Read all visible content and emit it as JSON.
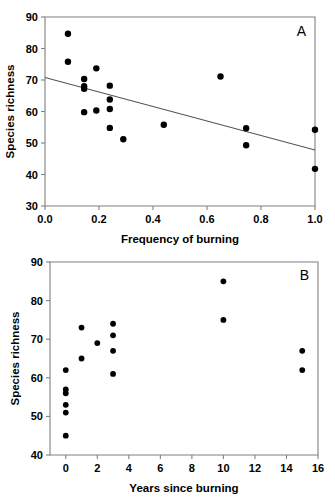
{
  "figure": {
    "title": "",
    "background": "#ffffff",
    "point_color": "#000000",
    "axis_color": "#808080",
    "line_color": "#555555"
  },
  "chart_data": [
    {
      "type": "scatter",
      "panel_label": "A",
      "title": "",
      "xlabel": "Frequency of burning",
      "ylabel": "Species richness",
      "xlim": [
        0.0,
        1.0
      ],
      "ylim": [
        30,
        90
      ],
      "xticks": [
        0.0,
        0.2,
        0.4,
        0.6,
        0.8,
        1.0
      ],
      "xtick_labels": [
        "0.0",
        "0.2",
        "0.4",
        "0.6",
        "0.8",
        "1.0"
      ],
      "yticks": [
        30,
        40,
        50,
        60,
        70,
        80,
        90
      ],
      "ytick_labels": [
        "30",
        "40",
        "50",
        "60",
        "70",
        "80",
        "90"
      ],
      "grid": false,
      "legend": false,
      "x": [
        0.085,
        0.085,
        0.145,
        0.145,
        0.145,
        0.145,
        0.19,
        0.19,
        0.24,
        0.24,
        0.24,
        0.24,
        0.29,
        0.44,
        0.65,
        0.745,
        0.745,
        1.0,
        1.0
      ],
      "y": [
        84.7,
        75.8,
        70.3,
        68.0,
        67.2,
        59.8,
        73.7,
        60.3,
        68.2,
        63.8,
        60.8,
        54.8,
        51.2,
        55.8,
        71.1,
        54.7,
        49.3,
        54.2,
        41.8
      ],
      "trendline": {
        "x": [
          0.0,
          1.0
        ],
        "y": [
          70.8,
          47.8
        ],
        "style": "solid"
      }
    },
    {
      "type": "scatter",
      "panel_label": "B",
      "title": "",
      "xlabel": "Years since burning",
      "ylabel": "Species richness",
      "xlim": [
        -1.0,
        16.0
      ],
      "ylim": [
        40,
        90
      ],
      "xticks": [
        0,
        2,
        4,
        6,
        8,
        10,
        12,
        14,
        16
      ],
      "xtick_labels": [
        "0",
        "2",
        "4",
        "6",
        "8",
        "10",
        "12",
        "14",
        "16"
      ],
      "yticks": [
        40,
        50,
        60,
        70,
        80,
        90
      ],
      "ytick_labels": [
        "40",
        "50",
        "60",
        "70",
        "80",
        "90"
      ],
      "grid": false,
      "legend": false,
      "x": [
        0,
        0,
        0,
        0,
        0,
        0,
        1,
        1,
        2,
        3,
        3,
        3,
        3,
        10,
        10,
        15,
        15
      ],
      "y": [
        62,
        57,
        56,
        53,
        51,
        45,
        73,
        65,
        69,
        74,
        71,
        67,
        61,
        85,
        75,
        67,
        62
      ],
      "trendline": null
    }
  ]
}
